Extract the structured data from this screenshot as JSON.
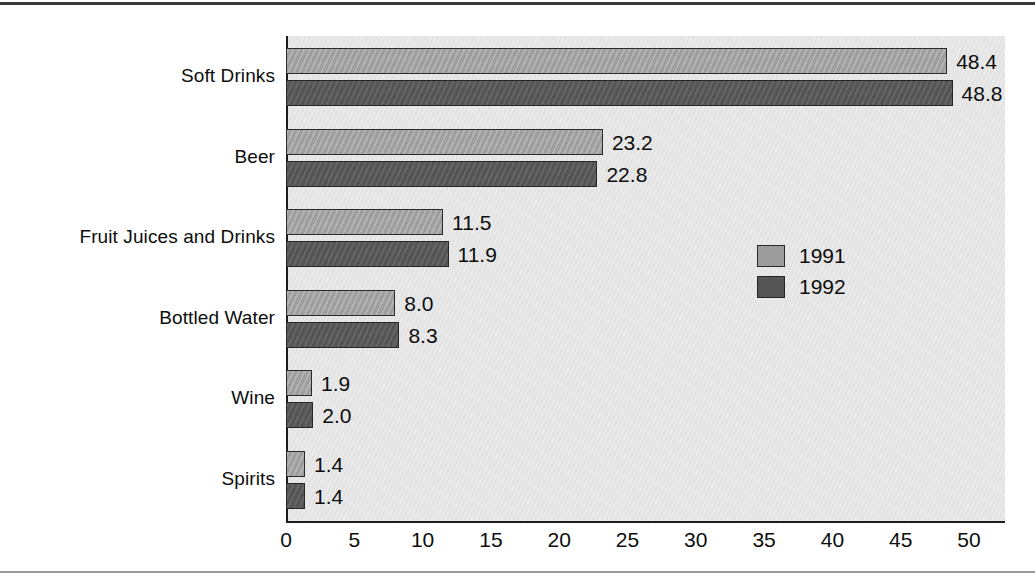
{
  "chart_data": {
    "type": "bar",
    "orientation": "horizontal",
    "title": "",
    "subtitle": "",
    "xlabel": "",
    "ylabel": "",
    "categories": [
      "Soft Drinks",
      "Beer",
      "Fruit Juices and Drinks",
      "Bottled Water",
      "Wine",
      "Spirits"
    ],
    "series": [
      {
        "name": "1991",
        "color": "#9d9d9d",
        "values": [
          48.4,
          23.2,
          11.5,
          8.0,
          1.9,
          1.4
        ],
        "value_labels": [
          "48.4",
          "23.2",
          "11.5",
          "8.0",
          "1.9",
          "1.4"
        ]
      },
      {
        "name": "1992",
        "color": "#545454",
        "values": [
          48.8,
          22.8,
          11.9,
          8.3,
          2.0,
          1.4
        ],
        "value_labels": [
          "48.8",
          "22.8",
          "11.9",
          "8.3",
          "2.0",
          "1.4"
        ]
      }
    ],
    "xlim": [
      0,
      50
    ],
    "xticks": [
      0,
      5,
      10,
      15,
      20,
      25,
      30,
      35,
      40,
      45,
      50
    ],
    "xtick_labels": [
      "0",
      "5",
      "10",
      "15",
      "20",
      "25",
      "30",
      "35",
      "40",
      "45",
      "50"
    ],
    "grid": false,
    "legend_position": "center-right",
    "plot_background": "#e4e4e4",
    "axis_color": "#1d1d1d"
  },
  "legend": {
    "entries": [
      {
        "label": "1991"
      },
      {
        "label": "1992"
      }
    ]
  }
}
